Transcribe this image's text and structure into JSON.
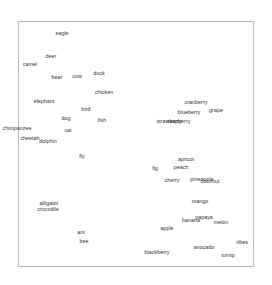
{
  "chart_data": {
    "type": "scatter",
    "title": "",
    "xlabel": "",
    "ylabel": "",
    "grid": false,
    "legend": null,
    "points": [
      {
        "label": "eagle",
        "x": 62,
        "y": 34
      },
      {
        "label": "deer",
        "x": 51,
        "y": 57
      },
      {
        "label": "camel",
        "x": 30,
        "y": 65
      },
      {
        "label": "bear",
        "x": 57,
        "y": 78
      },
      {
        "label": "cow",
        "x": 77,
        "y": 77
      },
      {
        "label": "duck",
        "x": 99,
        "y": 74
      },
      {
        "label": "chicken",
        "x": 104,
        "y": 93
      },
      {
        "label": "elephant",
        "x": 44,
        "y": 102
      },
      {
        "label": "bird",
        "x": 86,
        "y": 110
      },
      {
        "label": "dog",
        "x": 66,
        "y": 119
      },
      {
        "label": "fish",
        "x": 102,
        "y": 121
      },
      {
        "label": "chimpanzee",
        "x": 17,
        "y": 129
      },
      {
        "label": "cat",
        "x": 68,
        "y": 131
      },
      {
        "label": "cheetah",
        "x": 30,
        "y": 139
      },
      {
        "label": "dolphin",
        "x": 48,
        "y": 142
      },
      {
        "label": "fly",
        "x": 82,
        "y": 157
      },
      {
        "label": "cranberry",
        "x": 196,
        "y": 103
      },
      {
        "label": "blueberry",
        "x": 189,
        "y": 113
      },
      {
        "label": "grape",
        "x": 216,
        "y": 111
      },
      {
        "label": "strawberry",
        "x": 169,
        "y": 122
      },
      {
        "label": "raspberry",
        "x": 179,
        "y": 122
      },
      {
        "label": "apricot",
        "x": 186,
        "y": 160
      },
      {
        "label": "fig",
        "x": 155,
        "y": 169
      },
      {
        "label": "peach",
        "x": 181,
        "y": 168
      },
      {
        "label": "cherry",
        "x": 172,
        "y": 181
      },
      {
        "label": "pineapple",
        "x": 202,
        "y": 180
      },
      {
        "label": "coconut",
        "x": 210,
        "y": 182
      },
      {
        "label": "mango",
        "x": 200,
        "y": 202
      },
      {
        "label": "papaya",
        "x": 204,
        "y": 218
      },
      {
        "label": "banana",
        "x": 191,
        "y": 221
      },
      {
        "label": "melon",
        "x": 221,
        "y": 223
      },
      {
        "label": "apple",
        "x": 167,
        "y": 229
      },
      {
        "label": "alligator",
        "x": 49,
        "y": 204
      },
      {
        "label": "crocodile",
        "x": 48,
        "y": 210
      },
      {
        "label": "ant",
        "x": 81,
        "y": 233
      },
      {
        "label": "bee",
        "x": 84,
        "y": 242
      },
      {
        "label": "ribes",
        "x": 242,
        "y": 243
      },
      {
        "label": "avocado",
        "x": 204,
        "y": 248
      },
      {
        "label": "blackberry",
        "x": 157,
        "y": 253
      },
      {
        "label": "turnip",
        "x": 228,
        "y": 256
      }
    ]
  }
}
